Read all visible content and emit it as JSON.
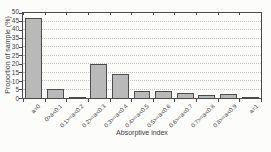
{
  "chart_data": {
    "type": "bar",
    "categories": [
      "a=0",
      "0>a<0.1",
      "0.1>=a<0.2",
      "0.2>=a<0.3",
      "0.3>=a<0.4",
      "0.4>=a<0.5",
      "0.5>=a<0.6",
      "0.6>=a<0.7",
      "0.7>=a<0.8",
      "0.8>=a<0.9",
      "a=1"
    ],
    "values": [
      47,
      5.5,
      0.8,
      20,
      14,
      4,
      4,
      3,
      2,
      2.5,
      0.8
    ],
    "xlabel": "Absorptive index",
    "ylabel": "Proportion of sample (%)",
    "ylim": [
      0,
      50
    ],
    "ytick_step": 5,
    "grid": "horizontal-dotted",
    "legend": "none",
    "colors": {
      "bar_fill": "#b9b9b9",
      "bar_border": "#4d4d4d",
      "axis": "#4a4a4a",
      "grid": "#c6c6c6",
      "text": "#3d3d3d",
      "background": "#fcfcfa"
    }
  }
}
